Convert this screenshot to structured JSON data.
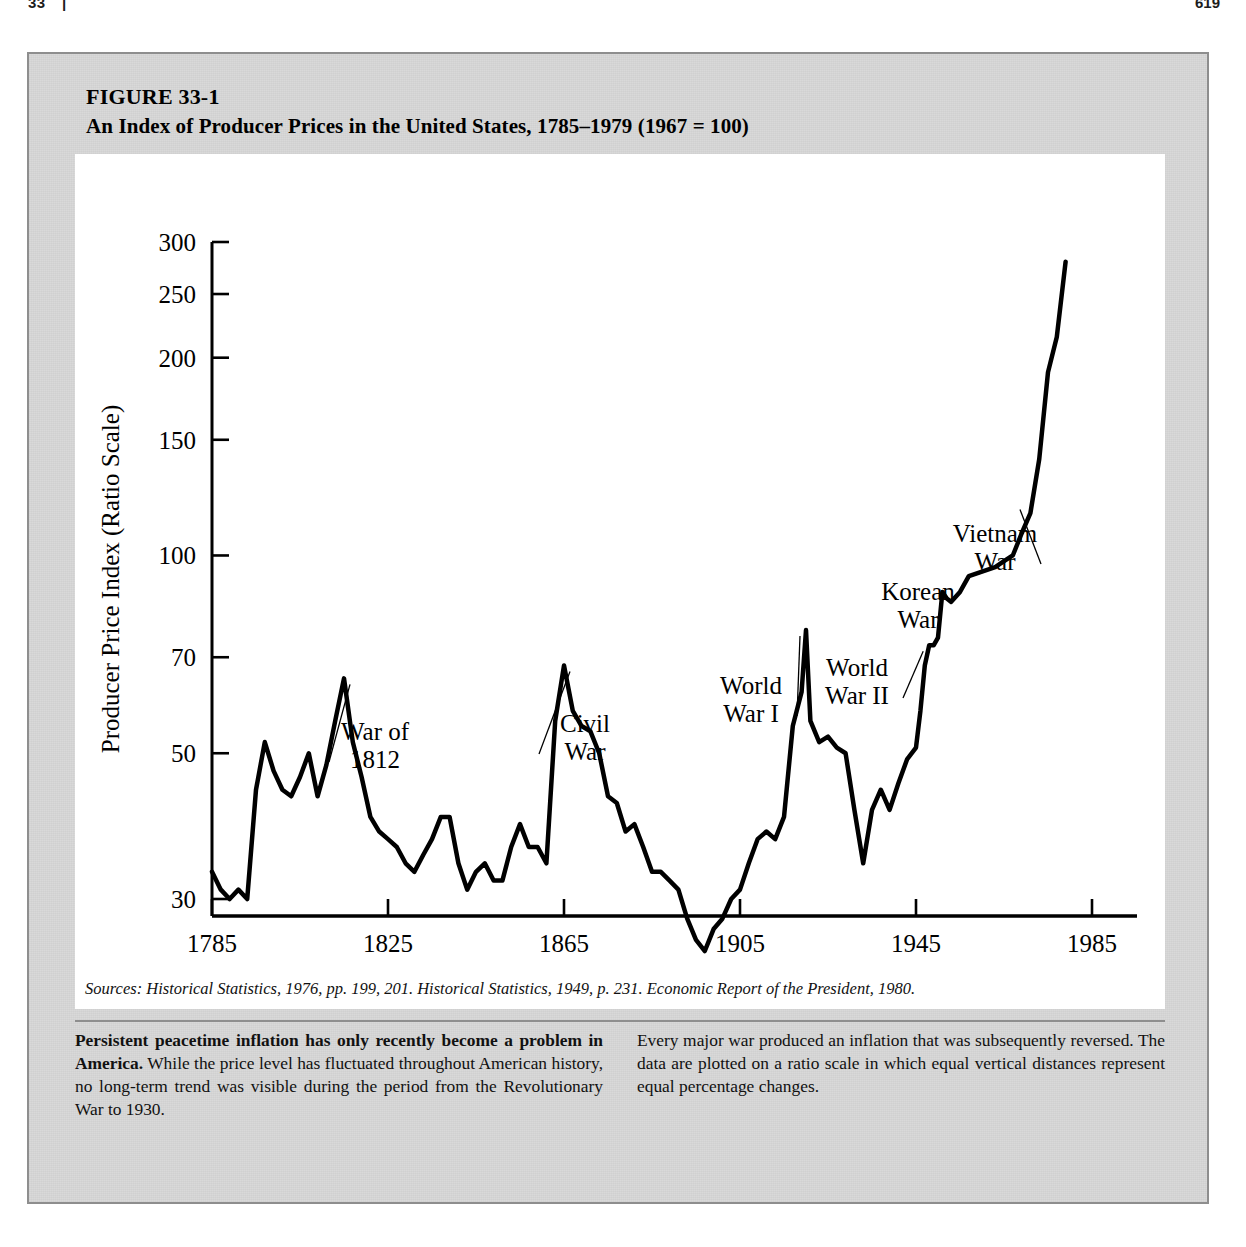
{
  "running_head": {
    "left": "33",
    "separator": "|",
    "title": "THE NATURE OF MONEY AND MONETARY INSTITUTIONS",
    "page": "619"
  },
  "figure": {
    "label": "FIGURE 33-1",
    "title": "An Index of Producer Prices in the United States, 1785–1979  (1967  =  100)",
    "source": "Sources:  Historical Statistics, 1976, pp. 199, 201.  Historical Statistics, 1949, p. 231.  Economic Report of the President, 1980."
  },
  "caption": {
    "left_bold": "Persistent peacetime inflation has only recently become a problem in America.",
    "left_rest": " While the price level has fluctuated throughout American history, no long-term trend was visible during the period from the Revolutionary War to 1930.",
    "right": "Every major war produced an inflation that was subsequently reversed. The data are plotted on a ratio scale in which equal vertical distances represent equal percentage changes."
  },
  "chart_data": {
    "type": "line",
    "title": "An Index of Producer Prices in the United States, 1785–1979 (1967 = 100)",
    "xlabel": "",
    "ylabel": "Producer Price Index (Ratio Scale)",
    "yscale": "log",
    "ylim": [
      20,
      310
    ],
    "xlim": [
      1785,
      1979
    ],
    "grid": false,
    "legend": "none",
    "ytick_labels": [
      "300",
      "250",
      "200",
      "150",
      "100",
      "70",
      "50",
      "30"
    ],
    "ytick_values": [
      300,
      250,
      200,
      150,
      100,
      70,
      50,
      30
    ],
    "xtick_labels": [
      "1785",
      "1825",
      "1865",
      "1905",
      "1945",
      "1985"
    ],
    "xtick_values": [
      1785,
      1825,
      1865,
      1905,
      1945,
      1985
    ],
    "series_name": "Producer Price Index",
    "line_color": "#000000",
    "line_width": 4.5,
    "x": [
      1785,
      1787,
      1789,
      1791,
      1793,
      1795,
      1797,
      1799,
      1801,
      1803,
      1805,
      1807,
      1809,
      1811,
      1813,
      1815,
      1817,
      1819,
      1821,
      1823,
      1825,
      1827,
      1829,
      1831,
      1833,
      1835,
      1837,
      1839,
      1841,
      1843,
      1845,
      1847,
      1849,
      1851,
      1853,
      1855,
      1857,
      1859,
      1861,
      1863,
      1865,
      1867,
      1869,
      1871,
      1873,
      1875,
      1877,
      1879,
      1881,
      1883,
      1885,
      1887,
      1889,
      1891,
      1893,
      1895,
      1897,
      1899,
      1901,
      1903,
      1905,
      1907,
      1909,
      1911,
      1913,
      1915,
      1917,
      1919,
      1920,
      1921,
      1923,
      1925,
      1927,
      1929,
      1931,
      1933,
      1935,
      1937,
      1939,
      1941,
      1943,
      1945,
      1946,
      1947,
      1948,
      1949,
      1950,
      1951,
      1952,
      1953,
      1955,
      1957,
      1959,
      1961,
      1963,
      1965,
      1967,
      1969,
      1971,
      1973,
      1975,
      1977,
      1979
    ],
    "y": [
      33,
      31,
      30,
      31,
      30,
      44,
      52,
      47,
      44,
      43,
      46,
      50,
      43,
      48,
      56,
      65,
      52,
      46,
      40,
      38,
      37,
      36,
      34,
      33,
      35,
      37,
      40,
      40,
      34,
      31,
      33,
      34,
      32,
      32,
      36,
      39,
      36,
      36,
      34,
      56,
      68,
      58,
      55,
      54,
      50,
      43,
      42,
      38,
      39,
      36,
      33,
      33,
      32,
      31,
      28,
      26,
      25,
      27,
      28,
      30,
      31,
      34,
      37,
      38,
      37,
      40,
      55,
      62,
      77,
      56,
      52,
      53,
      51,
      50,
      41,
      34,
      41,
      44,
      41,
      45,
      49,
      51,
      58,
      68,
      73,
      73,
      75,
      88,
      86,
      85,
      88,
      93,
      94,
      95,
      96,
      98,
      100,
      108,
      116,
      140,
      190,
      215,
      280
    ],
    "annotations": [
      {
        "text": "War of\n1812",
        "at_year": 1815,
        "at_value": 65,
        "label_x": 300,
        "label_y": 586
      },
      {
        "text": "Civil\nWar",
        "at_year": 1865,
        "at_value": 68,
        "label_x": 510,
        "label_y": 578
      },
      {
        "text": "World\nWar I",
        "at_year": 1920,
        "at_value": 77,
        "label_x": 676,
        "label_y": 540
      },
      {
        "text": "World\nWar II",
        "at_year": 1948,
        "at_value": 73,
        "label_x": 782,
        "label_y": 522
      },
      {
        "text": "Korean\nWar",
        "at_year": 1951,
        "at_value": 88,
        "label_x": 843,
        "label_y": 446
      },
      {
        "text": "Vietnam\nWar",
        "at_year": 1970,
        "at_value": 120,
        "label_x": 920,
        "label_y": 388
      }
    ]
  }
}
